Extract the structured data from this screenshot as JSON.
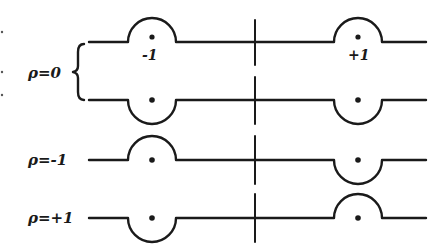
{
  "diagram": {
    "colors": {
      "ink": "#1a1a1a",
      "background": "#ffffff"
    },
    "vertical_axis_x": 255,
    "bump_centers_x": [
      152,
      358
    ],
    "bump_radius": 24,
    "line_span": [
      89,
      426
    ],
    "rows": [
      {
        "id": "rho0-upper",
        "y": 42,
        "group_label": "ρ = 0",
        "bumps": [
          "up",
          "up"
        ],
        "dot_labels": [
          "-1",
          "+1"
        ]
      },
      {
        "id": "rho0-lower",
        "y": 100,
        "group_label": "ρ = 0",
        "bumps": [
          "down",
          "down"
        ],
        "dot_labels": [
          "",
          ""
        ]
      },
      {
        "id": "rho-minus1",
        "y": 160,
        "label": "ρ = -1",
        "bumps": [
          "up",
          "down"
        ],
        "dot_labels": [
          "",
          ""
        ]
      },
      {
        "id": "rho-plus1",
        "y": 218,
        "label": "ρ = +1",
        "bumps": [
          "down",
          "up"
        ],
        "dot_labels": [
          "",
          ""
        ]
      }
    ],
    "labels": {
      "rho0": "ρ=0",
      "rho_minus1": "ρ=-1",
      "rho_plus1": "ρ=+1",
      "left_charge": "-1",
      "right_charge": "+1"
    }
  }
}
